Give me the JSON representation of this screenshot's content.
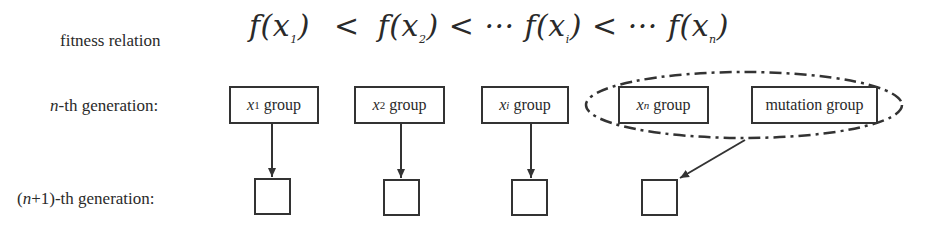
{
  "labels": {
    "fitness_relation": "fitness relation",
    "nth_generation_var": "n",
    "nth_generation_rest": "-th generation:",
    "next_generation_pre": "(",
    "next_generation_var": "n",
    "next_generation_rest": "+1)-th generation:"
  },
  "formula": {
    "terms": [
      "f(x",
      "1",
      ")",
      "<",
      "f(x",
      "2",
      ")",
      "<",
      "··· f(x",
      "i",
      ")",
      "<",
      "··· f(x",
      "n",
      ")"
    ]
  },
  "groups": [
    {
      "var": "x",
      "sub": "1",
      "text": " group"
    },
    {
      "var": "x",
      "sub": "2",
      "text": " group"
    },
    {
      "var": "x",
      "sub": "i",
      "text": " group"
    },
    {
      "var": "x",
      "sub": "n",
      "text": " group"
    },
    {
      "text": "mutation group"
    }
  ],
  "colors": {
    "stroke": "#333333",
    "background": "#ffffff"
  }
}
